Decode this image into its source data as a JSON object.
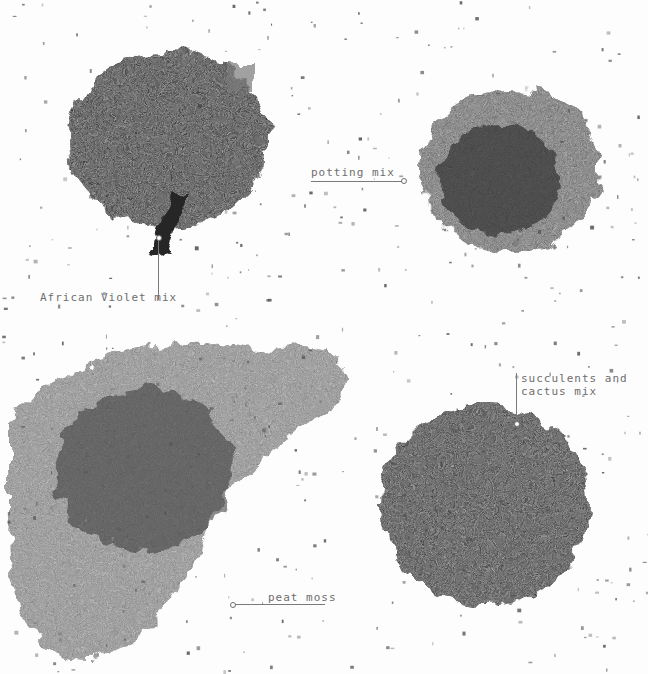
{
  "image": {
    "subject": "Four piles of potting soil types on a white background",
    "background_color": "#ffffff"
  },
  "piles": [
    {
      "id": "african-violet",
      "label": "African Violet mix",
      "tone": "#1f1f1f"
    },
    {
      "id": "potting",
      "label": "potting mix",
      "tone": "#3a3a3a"
    },
    {
      "id": "succulents",
      "label": "succulents and\ncactus mix",
      "tone": "#2c2c2c"
    },
    {
      "id": "peat",
      "label": "peat moss",
      "tone": "#4a4a4a"
    }
  ],
  "labels": {
    "african_violet": "African Violet mix",
    "potting": "potting mix",
    "succulents": "succulents and\ncactus mix",
    "peat": "peat moss"
  },
  "colors": {
    "label_text": "#6e6e6e",
    "leader_line": "#7a7a7a"
  }
}
